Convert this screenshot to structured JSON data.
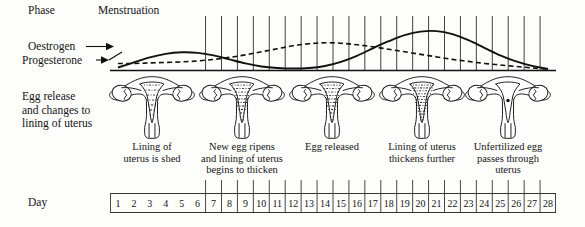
{
  "diagram": {
    "background_color": "#fdfdfc",
    "ink_color": "#111111"
  },
  "row_labels": {
    "phase": "Phase",
    "oestrogen": "Oestrogen",
    "progesterone": "Progesterone",
    "egg_line1": "Egg release",
    "egg_line2": "and changes to",
    "egg_line3": "lining of uterus",
    "day": "Day"
  },
  "phase": {
    "name": "Menstruation"
  },
  "captions": [
    {
      "id": "caption-1",
      "lines": [
        "Lining of",
        "uterus is shed"
      ]
    },
    {
      "id": "caption-2",
      "lines": [
        "New egg ripens",
        "and lining of uterus",
        "begins to thicken"
      ]
    },
    {
      "id": "caption-3",
      "lines": [
        "Egg released"
      ]
    },
    {
      "id": "caption-4",
      "lines": [
        "Lining of uterus",
        "thickens further"
      ]
    },
    {
      "id": "caption-5",
      "lines": [
        "Unfertilized egg",
        "passes through",
        "uterus"
      ]
    }
  ],
  "day_scale": {
    "days": [
      1,
      2,
      3,
      4,
      5,
      6,
      7,
      8,
      9,
      10,
      11,
      12,
      13,
      14,
      15,
      16,
      17,
      18,
      19,
      20,
      21,
      22,
      23,
      24,
      25,
      26,
      27,
      28
    ],
    "undivided_days": [
      1,
      2,
      3,
      4,
      5,
      6
    ],
    "first_boxed_day": 7,
    "last_day": 28
  },
  "uterus_stages": [
    {
      "id": "uterus-1",
      "label": "lining shed",
      "lining": "thin",
      "egg_dot": false
    },
    {
      "id": "uterus-2",
      "label": "lining thickening",
      "lining": "medium",
      "egg_dot": false
    },
    {
      "id": "uterus-3",
      "label": "egg released",
      "lining": "medium",
      "egg_dot": false
    },
    {
      "id": "uterus-4",
      "label": "lining thick",
      "lining": "thick",
      "egg_dot": false
    },
    {
      "id": "uterus-5",
      "label": "unfertilized egg passing",
      "lining": "thick-plain",
      "egg_dot": true
    }
  ],
  "chart_data": {
    "type": "line",
    "xlabel": "Day",
    "ylabel": "Hormone level",
    "xlim": [
      1,
      28
    ],
    "ylim": [
      0,
      1
    ],
    "grid": true,
    "legend": "inline-arrow-labels",
    "x": [
      1,
      2,
      3,
      4,
      5,
      6,
      7,
      8,
      9,
      10,
      11,
      12,
      13,
      14,
      15,
      16,
      17,
      18,
      19,
      20,
      21,
      22,
      23,
      24,
      25,
      26,
      27,
      28
    ],
    "series": [
      {
        "name": "Progesterone",
        "style": "solid",
        "color": "#111111",
        "values": [
          0.06,
          0.16,
          0.26,
          0.33,
          0.36,
          0.35,
          0.3,
          0.22,
          0.14,
          0.08,
          0.05,
          0.04,
          0.05,
          0.09,
          0.17,
          0.29,
          0.44,
          0.58,
          0.7,
          0.77,
          0.78,
          0.72,
          0.6,
          0.45,
          0.3,
          0.18,
          0.09,
          0.03
        ]
      },
      {
        "name": "Oestrogen",
        "style": "dashed",
        "color": "#111111",
        "values": [
          0.14,
          0.14,
          0.15,
          0.16,
          0.17,
          0.19,
          0.22,
          0.26,
          0.31,
          0.37,
          0.43,
          0.49,
          0.53,
          0.55,
          0.54,
          0.51,
          0.47,
          0.42,
          0.37,
          0.32,
          0.27,
          0.22,
          0.18,
          0.14,
          0.11,
          0.08,
          0.05,
          0.03
        ]
      }
    ],
    "annotations": [
      {
        "text": "Menstruation",
        "x": 1,
        "note": "phase label over days 1-6"
      }
    ]
  }
}
